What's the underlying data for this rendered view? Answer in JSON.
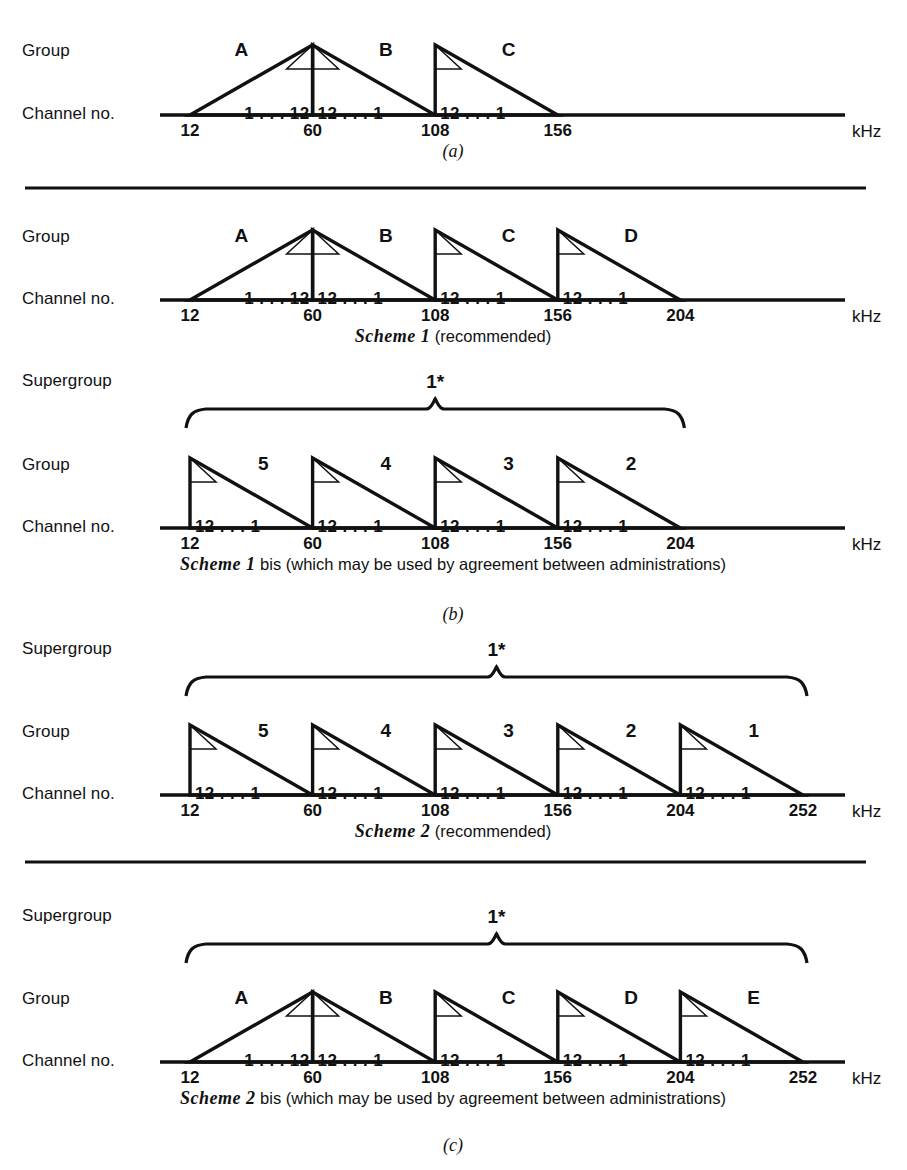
{
  "figure": {
    "unit_label": "kHz",
    "row_labels": {
      "group": "Group",
      "channel": "Channel no.",
      "supergroup": "Supergroup"
    },
    "supergroup_label": "1*",
    "channel_ascending": "1 . . . 12",
    "channel_descending": "12 . . . 1"
  },
  "chart_data": {
    "type": "diagram",
    "xlabel": "kHz",
    "ylabel": "",
    "axis_unit": "kHz",
    "grid": false,
    "legend": "none",
    "panels": [
      {
        "id": "a",
        "panel_letter": "(a)",
        "caption": "",
        "caption_italic": "",
        "caption_rest": "",
        "has_supergroup": false,
        "supergroup_label": "",
        "supergroup_span": [],
        "axis_ticks": [
          12,
          60,
          108,
          156
        ],
        "axis_min": 12,
        "axis_max": 156,
        "groups": [
          {
            "name": "A",
            "from": 12,
            "to": 60,
            "orientation": "erect",
            "channels": "1 . . . 12"
          },
          {
            "name": "B",
            "from": 60,
            "to": 108,
            "orientation": "inverted",
            "channels": "12 . . . 1"
          },
          {
            "name": "C",
            "from": 108,
            "to": 156,
            "orientation": "inverted",
            "channels": "12 . . . 1"
          }
        ]
      },
      {
        "id": "b1",
        "panel_letter": "",
        "caption_italic": "Scheme 1",
        "caption_rest": " (recommended)",
        "has_supergroup": false,
        "supergroup_label": "",
        "supergroup_span": [],
        "axis_ticks": [
          12,
          60,
          108,
          156,
          204
        ],
        "axis_min": 12,
        "axis_max": 204,
        "groups": [
          {
            "name": "A",
            "from": 12,
            "to": 60,
            "orientation": "erect",
            "channels": "1 . . . 12"
          },
          {
            "name": "B",
            "from": 60,
            "to": 108,
            "orientation": "inverted",
            "channels": "12 . . . 1"
          },
          {
            "name": "C",
            "from": 108,
            "to": 156,
            "orientation": "inverted",
            "channels": "12 . . . 1"
          },
          {
            "name": "D",
            "from": 156,
            "to": 204,
            "orientation": "inverted",
            "channels": "12 . . . 1"
          }
        ]
      },
      {
        "id": "b2",
        "panel_letter": "(b)",
        "caption_italic": "Scheme 1",
        "caption_rest": " bis (which may be used by agreement between administrations)",
        "has_supergroup": true,
        "supergroup_label": "1*",
        "supergroup_span": [
          12,
          204
        ],
        "axis_ticks": [
          12,
          60,
          108,
          156,
          204
        ],
        "axis_min": 12,
        "axis_max": 204,
        "groups": [
          {
            "name": "5",
            "from": 12,
            "to": 60,
            "orientation": "inverted",
            "channels": "12 . . . 1"
          },
          {
            "name": "4",
            "from": 60,
            "to": 108,
            "orientation": "inverted",
            "channels": "12 . . . 1"
          },
          {
            "name": "3",
            "from": 108,
            "to": 156,
            "orientation": "inverted",
            "channels": "12 . . . 1"
          },
          {
            "name": "2",
            "from": 156,
            "to": 204,
            "orientation": "inverted",
            "channels": "12 . . . 1"
          }
        ]
      },
      {
        "id": "c1",
        "panel_letter": "",
        "caption_italic": "Scheme 2",
        "caption_rest": " (recommended)",
        "has_supergroup": true,
        "supergroup_label": "1*",
        "supergroup_span": [
          12,
          252
        ],
        "axis_ticks": [
          12,
          60,
          108,
          156,
          204,
          252
        ],
        "axis_min": 12,
        "axis_max": 252,
        "groups": [
          {
            "name": "5",
            "from": 12,
            "to": 60,
            "orientation": "inverted",
            "channels": "12 . . . 1"
          },
          {
            "name": "4",
            "from": 60,
            "to": 108,
            "orientation": "inverted",
            "channels": "12 . . . 1"
          },
          {
            "name": "3",
            "from": 108,
            "to": 156,
            "orientation": "inverted",
            "channels": "12 . . . 1"
          },
          {
            "name": "2",
            "from": 156,
            "to": 204,
            "orientation": "inverted",
            "channels": "12 . . . 1"
          },
          {
            "name": "1",
            "from": 204,
            "to": 252,
            "orientation": "inverted",
            "channels": "12 . . . 1"
          }
        ]
      },
      {
        "id": "c2",
        "panel_letter": "(c)",
        "caption_italic": "Scheme 2",
        "caption_rest": " bis (which may be used by agreement between administrations)",
        "has_supergroup": true,
        "supergroup_label": "1*",
        "supergroup_span": [
          12,
          252
        ],
        "axis_ticks": [
          12,
          60,
          108,
          156,
          204,
          252
        ],
        "axis_min": 12,
        "axis_max": 252,
        "groups": [
          {
            "name": "A",
            "from": 12,
            "to": 60,
            "orientation": "erect",
            "channels": "1 . . . 12"
          },
          {
            "name": "B",
            "from": 60,
            "to": 108,
            "orientation": "inverted",
            "channels": "12 . . . 1"
          },
          {
            "name": "C",
            "from": 108,
            "to": 156,
            "orientation": "inverted",
            "channels": "12 . . . 1"
          },
          {
            "name": "D",
            "from": 156,
            "to": 204,
            "orientation": "inverted",
            "channels": "12 . . . 1"
          },
          {
            "name": "E",
            "from": 204,
            "to": 252,
            "orientation": "inverted",
            "channels": "12 . . . 1"
          }
        ]
      }
    ],
    "dividers": 2,
    "colors": {
      "ink": "#111111",
      "paper": "#ffffff"
    }
  }
}
